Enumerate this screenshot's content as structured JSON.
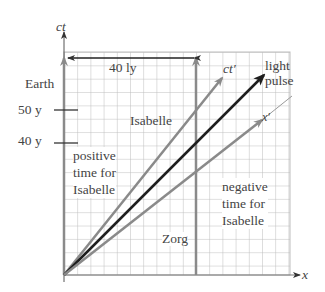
{
  "diagram": {
    "type": "spacetime-diagram",
    "axes": {
      "x_label": "x",
      "y_label": "ct",
      "x_prime_label": "x′",
      "ct_prime_label": "ct′"
    },
    "distance_marker": {
      "label": "40 ly"
    },
    "worldlines": {
      "earth": "Earth",
      "zorg": "Zorg",
      "isabelle": "Isabelle",
      "light": "light\npulse"
    },
    "time_ticks": [
      {
        "label": "50 y"
      },
      {
        "label": "40 y"
      }
    ],
    "regions": {
      "positive": "positive\ntime for\nIsabelle",
      "negative": "negative\ntime for\nIsabelle"
    },
    "colors": {
      "grid": "#b8b8b8",
      "axis": "#777777",
      "worldline_gray": "#8a8a8a",
      "light": "#1e1e1e",
      "text": "#444444"
    }
  }
}
